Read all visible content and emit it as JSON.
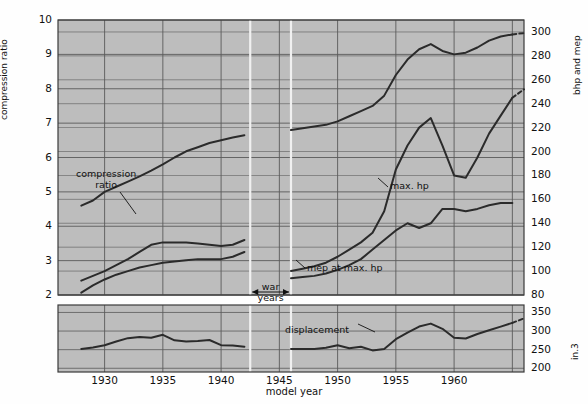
{
  "figure": {
    "background": "#bdbdbd",
    "grid_color": "#5a5a5a",
    "line_color": "#2b2b2b",
    "gap_color": "#f0f0f0"
  },
  "axes": {
    "x": {
      "label": "model year",
      "ticks": [
        1930,
        1935,
        1940,
        1945,
        1950,
        1955,
        1960,
        1965
      ],
      "tick_labels": [
        "1930",
        "1935",
        "1940",
        "1945",
        "1950",
        "1955",
        "1960",
        ""
      ],
      "min": 1926,
      "max": 1966
    },
    "y_left": {
      "label": "compression ratio",
      "ticks": [
        2,
        3,
        4,
        5,
        6,
        7,
        8,
        9,
        10
      ],
      "tick_labels": [
        "2",
        "3",
        "4",
        "5",
        "6",
        "7",
        "8",
        "9",
        "10"
      ],
      "min": 2,
      "max": 10
    },
    "y_right_top": {
      "label": "bhp and mep",
      "ticks": [
        80,
        100,
        120,
        140,
        160,
        180,
        200,
        220,
        240,
        260,
        280,
        300
      ],
      "tick_labels": [
        "80",
        "100",
        "120",
        "140",
        "160",
        "180",
        "200",
        "220",
        "240",
        "260",
        "280",
        "300"
      ],
      "min": 80,
      "max": 310
    },
    "y_right_bottom": {
      "label": "in.3",
      "ticks": [
        200,
        250,
        300,
        350
      ],
      "tick_labels": [
        "200",
        "250",
        "300",
        "350"
      ],
      "min": 190,
      "max": 370
    }
  },
  "annotations": [
    {
      "name": "compression-ratio-label",
      "text_line1": "compression",
      "text_line2": "ratio"
    },
    {
      "name": "max-hp-label",
      "text": "max. hp"
    },
    {
      "name": "mep-at-max-hp-label",
      "text": "mep at max. hp"
    },
    {
      "name": "displacement-label",
      "text": "displacement"
    },
    {
      "name": "war-years-label",
      "text_line1": "war",
      "text_line2": "years"
    }
  ],
  "chart_data": {
    "type": "line",
    "title": "",
    "xlabel": "model year",
    "ylabel": "compression ratio",
    "ylabel_right": "bhp and mep",
    "ylabel_right_lower": "in.3",
    "xlim": [
      1926,
      1966
    ],
    "ylim": [
      2,
      10
    ],
    "ylim_right": [
      80,
      310
    ],
    "ylim_lower_right": [
      190,
      370
    ],
    "grid": true,
    "legend": "inline-annotations",
    "war_years": [
      1942.5,
      1946
    ],
    "series": [
      {
        "name": "compression ratio (prewar)",
        "axis": "left",
        "units": "ratio",
        "x": [
          1928,
          1929,
          1930,
          1931,
          1932,
          1933,
          1934,
          1935,
          1936,
          1937,
          1938,
          1939,
          1940,
          1941,
          1942
        ],
        "y": [
          4.6,
          4.75,
          5.0,
          5.15,
          5.3,
          5.45,
          5.62,
          5.8,
          6.0,
          6.18,
          6.3,
          6.42,
          6.5,
          6.58,
          6.65
        ]
      },
      {
        "name": "compression ratio (postwar)",
        "axis": "left",
        "units": "ratio",
        "x": [
          1946,
          1947,
          1948,
          1949,
          1950,
          1951,
          1952,
          1953,
          1954,
          1955,
          1956,
          1957,
          1958,
          1959,
          1960,
          1961,
          1962,
          1963,
          1964,
          1965
        ],
        "y": [
          6.8,
          6.85,
          6.9,
          6.95,
          7.05,
          7.2,
          7.35,
          7.5,
          7.8,
          8.4,
          8.85,
          9.15,
          9.3,
          9.1,
          9.0,
          9.05,
          9.2,
          9.4,
          9.52,
          9.58
        ]
      },
      {
        "name": "mep at max. hp (prewar, upper)",
        "axis": "right",
        "units": "mep",
        "x": [
          1928,
          1929,
          1930,
          1931,
          1932,
          1933,
          1934,
          1935,
          1936,
          1937,
          1938,
          1939,
          1940,
          1941,
          1942
        ],
        "y": [
          92,
          96,
          100,
          105,
          110,
          116,
          122,
          124,
          124,
          124,
          123,
          122,
          121,
          122,
          126
        ]
      },
      {
        "name": "bhp (prewar, lower)",
        "axis": "right",
        "units": "bhp",
        "x": [
          1928,
          1929,
          1930,
          1931,
          1932,
          1933,
          1934,
          1935,
          1936,
          1937,
          1938,
          1939,
          1940,
          1941,
          1942
        ],
        "y": [
          82,
          88,
          93,
          97,
          100,
          103,
          105,
          107,
          108,
          109,
          110,
          110,
          110,
          112,
          116
        ]
      },
      {
        "name": "max. hp (postwar)",
        "axis": "right",
        "units": "bhp",
        "x": [
          1946,
          1947,
          1948,
          1949,
          1950,
          1951,
          1952,
          1953,
          1954,
          1955,
          1956,
          1957,
          1958,
          1959,
          1960,
          1961,
          1962,
          1963,
          1964,
          1965
        ],
        "y": [
          100,
          102,
          104,
          107,
          112,
          118,
          124,
          132,
          150,
          185,
          205,
          220,
          228,
          205,
          180,
          178,
          195,
          215,
          230,
          245
        ]
      },
      {
        "name": "mep at max. hp (postwar)",
        "axis": "right",
        "units": "mep",
        "x": [
          1946,
          1947,
          1948,
          1949,
          1950,
          1951,
          1952,
          1953,
          1954,
          1955,
          1956,
          1957,
          1958,
          1959,
          1960,
          1961,
          1962,
          1963,
          1964,
          1965
        ],
        "y": [
          94,
          95,
          96,
          98,
          101,
          105,
          110,
          118,
          126,
          134,
          140,
          136,
          140,
          152,
          152,
          150,
          152,
          155,
          157,
          157
        ]
      },
      {
        "name": "displacement (prewar)",
        "axis": "lower-right",
        "units": "in.3",
        "x": [
          1928,
          1929,
          1930,
          1931,
          1932,
          1933,
          1934,
          1935,
          1936,
          1937,
          1938,
          1939,
          1940,
          1941,
          1942
        ],
        "y": [
          252,
          256,
          262,
          272,
          281,
          284,
          282,
          290,
          275,
          272,
          273,
          276,
          262,
          261,
          258
        ]
      },
      {
        "name": "displacement (postwar)",
        "axis": "lower-right",
        "units": "in.3",
        "x": [
          1946,
          1947,
          1948,
          1949,
          1950,
          1951,
          1952,
          1953,
          1954,
          1955,
          1956,
          1957,
          1958,
          1959,
          1960,
          1961,
          1962,
          1963,
          1964,
          1965
        ],
        "y": [
          252,
          252,
          252,
          255,
          262,
          254,
          258,
          248,
          252,
          278,
          296,
          312,
          320,
          306,
          282,
          280,
          292,
          302,
          312,
          322
        ]
      }
    ]
  }
}
